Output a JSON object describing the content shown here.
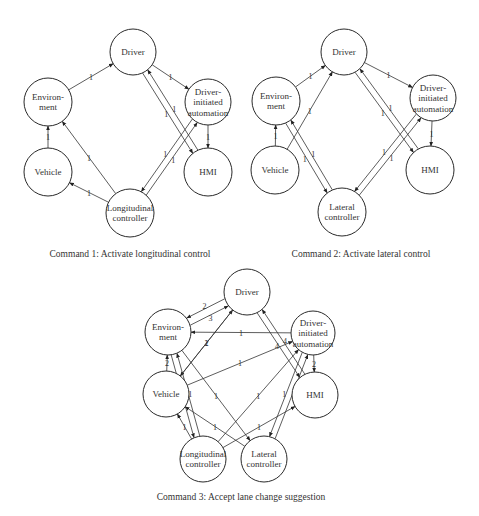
{
  "figures": [
    {
      "id": "cmd1",
      "caption": "Command 1: Activate longitudinal control",
      "caption_pos": [
        130,
        257
      ],
      "nodes": [
        {
          "id": "driver",
          "lines": [
            "Driver"
          ],
          "x": 133,
          "y": 52,
          "r": 23
        },
        {
          "id": "env",
          "lines": [
            "Environ-",
            "ment"
          ],
          "x": 48,
          "y": 102,
          "r": 24
        },
        {
          "id": "dia",
          "lines": [
            "Driver-",
            "initiated",
            "automation"
          ],
          "x": 208,
          "y": 102,
          "r": 23
        },
        {
          "id": "vehicle",
          "lines": [
            "Vehicle"
          ],
          "x": 48,
          "y": 172,
          "r": 24
        },
        {
          "id": "hmi",
          "lines": [
            "HMI"
          ],
          "x": 208,
          "y": 172,
          "r": 24
        },
        {
          "id": "lon",
          "lines": [
            "Longitudinal",
            "controller"
          ],
          "x": 130,
          "y": 213,
          "r": 24
        }
      ],
      "edges": [
        {
          "from": "env",
          "to": "driver",
          "label": "1"
        },
        {
          "from": "driver",
          "to": "dia",
          "label": "1"
        },
        {
          "from": "vehicle",
          "to": "env",
          "label": "1"
        },
        {
          "from": "lon",
          "to": "env",
          "label": "1"
        },
        {
          "from": "lon",
          "to": "vehicle",
          "label": "1"
        },
        {
          "from": "driver",
          "to": "hmi",
          "label": "1",
          "off": 3
        },
        {
          "from": "hmi",
          "to": "driver",
          "label": "1",
          "off": 3
        },
        {
          "from": "dia",
          "to": "hmi",
          "label": "1"
        },
        {
          "from": "dia",
          "to": "lon",
          "label": "1",
          "off": 3
        },
        {
          "from": "lon",
          "to": "dia",
          "label": "1",
          "off": 3
        }
      ]
    },
    {
      "id": "cmd2",
      "caption": "Command 2: Activate lateral control",
      "caption_pos": [
        361,
        257
      ],
      "nodes": [
        {
          "id": "driver",
          "lines": [
            "Driver"
          ],
          "x": 344,
          "y": 52,
          "r": 23
        },
        {
          "id": "env",
          "lines": [
            "Environ-",
            "ment"
          ],
          "x": 276,
          "y": 101,
          "r": 24
        },
        {
          "id": "dia",
          "lines": [
            "Driver-",
            "initiated",
            "automation"
          ],
          "x": 433,
          "y": 98,
          "r": 23
        },
        {
          "id": "vehicle",
          "lines": [
            "Vehicle"
          ],
          "x": 275,
          "y": 170,
          "r": 24
        },
        {
          "id": "hmi",
          "lines": [
            "HMI"
          ],
          "x": 430,
          "y": 170,
          "r": 24
        },
        {
          "id": "lat",
          "lines": [
            "Lateral",
            "controller"
          ],
          "x": 342,
          "y": 212,
          "r": 24
        }
      ],
      "edges": [
        {
          "from": "env",
          "to": "driver",
          "label": "1"
        },
        {
          "from": "driver",
          "to": "dia",
          "label": "1"
        },
        {
          "from": "vehicle",
          "to": "env",
          "label": "1"
        },
        {
          "from": "vehicle",
          "to": "driver",
          "label": "1"
        },
        {
          "from": "env",
          "to": "lat",
          "label": "1",
          "off": 3
        },
        {
          "from": "lat",
          "to": "env",
          "label": "1",
          "off": 3
        },
        {
          "from": "driver",
          "to": "hmi",
          "label": "1",
          "off": 3
        },
        {
          "from": "hmi",
          "to": "driver",
          "label": "1",
          "off": 3
        },
        {
          "from": "dia",
          "to": "hmi",
          "label": "1"
        },
        {
          "from": "dia",
          "to": "lat",
          "label": "1",
          "off": 3
        },
        {
          "from": "lat",
          "to": "dia",
          "label": "1",
          "off": 3
        }
      ]
    },
    {
      "id": "cmd3",
      "caption": "Command 3: Accept lane change suggestion",
      "caption_pos": [
        241,
        500
      ],
      "nodes": [
        {
          "id": "driver",
          "lines": [
            "Driver"
          ],
          "x": 247,
          "y": 292,
          "r": 23
        },
        {
          "id": "env",
          "lines": [
            "Environ-",
            "ment"
          ],
          "x": 168,
          "y": 332,
          "r": 23
        },
        {
          "id": "dia",
          "lines": [
            "Driver-",
            "initiated",
            "automation"
          ],
          "x": 313,
          "y": 333,
          "r": 22
        },
        {
          "id": "vehicle",
          "lines": [
            "Vehicle"
          ],
          "x": 166,
          "y": 394,
          "r": 23
        },
        {
          "id": "hmi",
          "lines": [
            "HMI"
          ],
          "x": 315,
          "y": 395,
          "r": 23
        },
        {
          "id": "lon",
          "lines": [
            "Longitudinal",
            "controller"
          ],
          "x": 203,
          "y": 459,
          "r": 23
        },
        {
          "id": "lat",
          "lines": [
            "Lateral",
            "controller"
          ],
          "x": 264,
          "y": 459,
          "r": 23
        }
      ],
      "edges": [
        {
          "from": "env",
          "to": "driver",
          "label": "3",
          "off": 4
        },
        {
          "from": "driver",
          "to": "env",
          "label": "2",
          "off": 4
        },
        {
          "from": "dia",
          "to": "env",
          "label": "1"
        },
        {
          "from": "vehicle",
          "to": "env",
          "label": "2"
        },
        {
          "from": "vehicle",
          "to": "driver",
          "label": "2"
        },
        {
          "from": "driver",
          "to": "vehicle",
          "label": "1"
        },
        {
          "from": "vehicle",
          "to": "dia",
          "label": "1"
        },
        {
          "from": "env",
          "to": "lon",
          "label": "1",
          "off": 3
        },
        {
          "from": "lon",
          "to": "env",
          "label": "1",
          "off": 3
        },
        {
          "from": "env",
          "to": "lat",
          "label": "1"
        },
        {
          "from": "driver",
          "to": "hmi",
          "label": "4",
          "off": 3
        },
        {
          "from": "hmi",
          "to": "driver",
          "label": "4",
          "off": 3
        },
        {
          "from": "dia",
          "to": "hmi",
          "label": "2"
        },
        {
          "from": "lon",
          "to": "dia",
          "label": "1"
        },
        {
          "from": "lon",
          "to": "hmi",
          "label": "1"
        },
        {
          "from": "lat",
          "to": "vehicle",
          "label": "1"
        },
        {
          "from": "lon",
          "to": "vehicle",
          "label": "1"
        },
        {
          "from": "dia",
          "to": "lat",
          "label": "1",
          "off": 3
        },
        {
          "from": "lat",
          "to": "dia",
          "label": "1",
          "off": 3
        }
      ]
    }
  ]
}
